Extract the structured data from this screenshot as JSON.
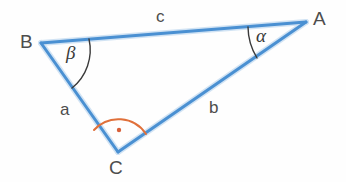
{
  "figure": {
    "kind": "geometry-diagram",
    "background_color": "#fefefe"
  },
  "style": {
    "triangle_stroke": "#4a90d2",
    "triangle_stroke_soft": "#9cc4e8",
    "triangle_stroke_width": 3,
    "angle_arc_stroke": "#3a3a3a",
    "right_angle_stroke": "#e0703a",
    "right_angle_dot": "#d8603a",
    "text_color": "#4d4d4d"
  },
  "geometry": {
    "vertices": [
      {
        "name": "A",
        "x": 306,
        "y": 22
      },
      {
        "name": "B",
        "x": 41,
        "y": 43
      },
      {
        "name": "C",
        "x": 118,
        "y": 152
      }
    ],
    "sides": [
      {
        "name": "a",
        "from": "B",
        "to": "C"
      },
      {
        "name": "b",
        "from": "C",
        "to": "A"
      },
      {
        "name": "c",
        "from": "A",
        "to": "B"
      }
    ],
    "angles": [
      {
        "name": "alpha",
        "at": "A",
        "marker": "arc"
      },
      {
        "name": "beta",
        "at": "B",
        "marker": "arc"
      },
      {
        "name": "gamma",
        "at": "C",
        "marker": "right-angle-arc-with-dot"
      }
    ]
  },
  "labels": {
    "vertex_a": "A",
    "vertex_b": "B",
    "vertex_c": "C",
    "side_a": "a",
    "side_b": "b",
    "side_c": "c",
    "angle_alpha": "α",
    "angle_beta": "β"
  }
}
